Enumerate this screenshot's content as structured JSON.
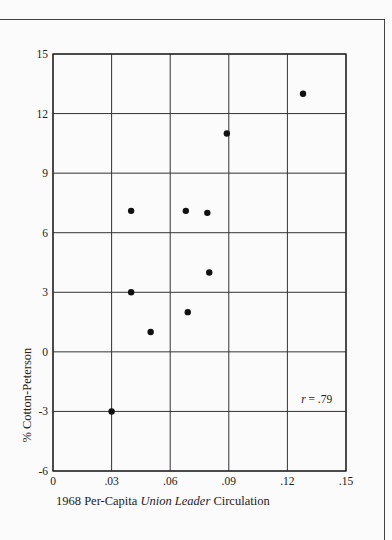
{
  "chart_data": {
    "type": "scatter",
    "title": "",
    "xlabel": "1968 Per-Capita Union Leader Circulation",
    "xlabel_parts": [
      {
        "text": "1968 Per-Capita ",
        "italic": false
      },
      {
        "text": "Union Leader",
        "italic": true
      },
      {
        "text": " Circulation",
        "italic": false
      }
    ],
    "ylabel": "% Cotton-Peterson",
    "xlim": [
      0,
      0.15
    ],
    "ylim": [
      -6,
      15
    ],
    "x_ticks": [
      0,
      0.03,
      0.06,
      0.09,
      0.12,
      0.15
    ],
    "x_tick_labels": [
      "0",
      ".03",
      ".06",
      ".09",
      ".12",
      ".15"
    ],
    "y_ticks": [
      15,
      12,
      9,
      6,
      3,
      0,
      -3,
      -6
    ],
    "y_tick_labels": [
      "15",
      "12",
      "9",
      "6",
      "3",
      "0",
      "-3",
      "-6"
    ],
    "grid": true,
    "legend": null,
    "annotation": {
      "text_italic": "r",
      "text_rest": " = .79",
      "x": 0.135,
      "y": -2.6
    },
    "points": [
      {
        "x": 0.128,
        "y": 13.0
      },
      {
        "x": 0.089,
        "y": 11.0
      },
      {
        "x": 0.04,
        "y": 7.1
      },
      {
        "x": 0.068,
        "y": 7.1
      },
      {
        "x": 0.079,
        "y": 7.0
      },
      {
        "x": 0.08,
        "y": 4.0
      },
      {
        "x": 0.04,
        "y": 3.0
      },
      {
        "x": 0.069,
        "y": 2.0
      },
      {
        "x": 0.05,
        "y": 1.0
      },
      {
        "x": 0.03,
        "y": -3.0
      }
    ]
  },
  "colors": {
    "ink": "#222222",
    "paper": "#fbfbfb"
  }
}
